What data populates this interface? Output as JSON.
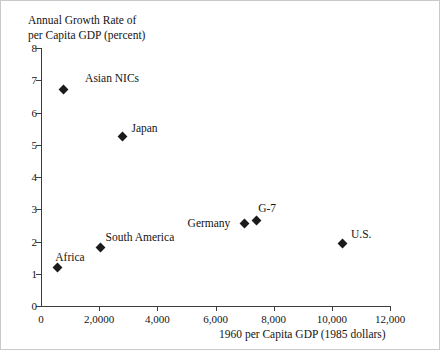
{
  "chart_data": {
    "type": "scatter",
    "title": "",
    "ylabel": "Annual Growth Rate of\nper Capita GDP (percent)",
    "xlabel": "1960 per Capita GDP (1985 dollars)",
    "xlim": [
      0,
      12000
    ],
    "ylim": [
      0,
      8
    ],
    "grid": false,
    "legend": "none",
    "xticks": [
      {
        "value": 0,
        "label": "0"
      },
      {
        "value": 2000,
        "label": "2,0000"
      },
      {
        "value": 4000,
        "label": "4,000"
      },
      {
        "value": 6000,
        "label": "6,000"
      },
      {
        "value": 8000,
        "label": "8,000"
      },
      {
        "value": 10000,
        "label": "10,000"
      },
      {
        "value": 12000,
        "label": "12,000"
      }
    ],
    "yticks": [
      {
        "value": 0,
        "label": "0"
      },
      {
        "value": 1,
        "label": "1"
      },
      {
        "value": 2,
        "label": "2"
      },
      {
        "value": 3,
        "label": "3"
      },
      {
        "value": 4,
        "label": "4"
      },
      {
        "value": 5,
        "label": "5"
      },
      {
        "value": 6,
        "label": "6"
      },
      {
        "value": 7,
        "label": "7"
      },
      {
        "value": 8,
        "label": "8"
      }
    ],
    "points": [
      {
        "label": "Africa",
        "x": 560,
        "y": 1.2,
        "label_dx": -2,
        "label_dy": -16,
        "label_align": "left"
      },
      {
        "label": "South America",
        "x": 2050,
        "y": 1.8,
        "label_dx": 5,
        "label_dy": -17,
        "label_align": "left"
      },
      {
        "label": "Asian NICs",
        "x": 760,
        "y": 6.7,
        "label_dx": 22,
        "label_dy": -18,
        "label_align": "left"
      },
      {
        "label": "Japan",
        "x": 2800,
        "y": 5.25,
        "label_dx": 9,
        "label_dy": -15,
        "label_align": "left"
      },
      {
        "label": "Germany",
        "x": 7000,
        "y": 2.55,
        "label_dx": -57,
        "label_dy": -7,
        "label_align": "left"
      },
      {
        "label": "G-7",
        "x": 7400,
        "y": 2.65,
        "label_dx": 2,
        "label_dy": -19,
        "label_align": "left"
      },
      {
        "label": "U.S.",
        "x": 10350,
        "y": 1.95,
        "label_dx": 9,
        "label_dy": -15,
        "label_align": "left"
      }
    ],
    "marker_color": "#1b1b1b",
    "axis_color": "#3c3c3c"
  }
}
